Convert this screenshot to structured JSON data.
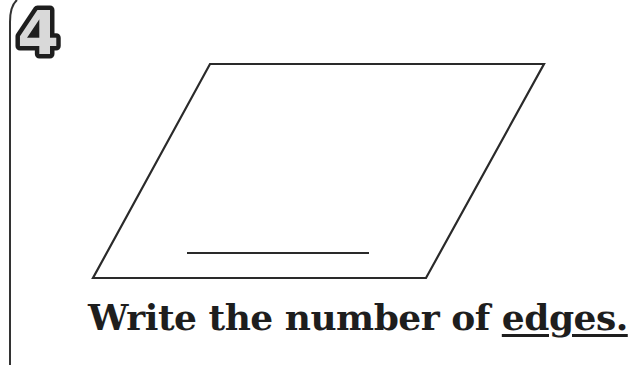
{
  "problem": {
    "number": "4",
    "number_colors": {
      "fill": "#d9d9d9",
      "outline": "#1e1e1e"
    },
    "shape": {
      "name": "parallelogram",
      "vertices": [
        [
          210,
          64
        ],
        [
          544,
          64
        ],
        [
          426,
          278
        ],
        [
          93,
          278
        ]
      ],
      "stroke": "#2a2a2a"
    },
    "answer_line": {
      "x1": 187,
      "y1": 253,
      "x2": 369,
      "y2": 253
    },
    "prompt_prefix": "Write the number of ",
    "prompt_keyword": "edges."
  }
}
